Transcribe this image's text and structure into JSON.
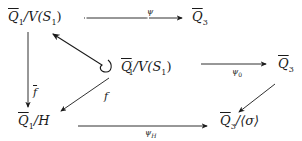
{
  "diagram": {
    "type": "commutative-diagram",
    "nodes": {
      "q1_vs1": {
        "base": "Q",
        "sub": "1",
        "rest": "/V(S",
        "rest_sub": "1",
        "close": ")"
      },
      "q3_top": {
        "base": "Q",
        "sub": "3"
      },
      "q1p_vs1": {
        "base": "Q",
        "prime": "′",
        "sub": "1",
        "rest": "/V(S",
        "rest_sub": "1",
        "close": ")"
      },
      "q3_right": {
        "base": "Q",
        "sub": "3"
      },
      "q1_h": {
        "base": "Q",
        "sub": "1",
        "rest": "/H"
      },
      "q3_sigma": {
        "base": "Q",
        "sub": "3",
        "rest": "/⟨σ⟩"
      }
    },
    "arrows": {
      "psi": {
        "label": "ψ",
        "from": "Q̄1/V(S1)",
        "to": "Q̄3"
      },
      "psi0": {
        "label": "ψ",
        "label_sub": "0",
        "from": "Q̄'1/V(S1)",
        "to": "Q̄3"
      },
      "psiH": {
        "label": "ψ",
        "label_sub": "H",
        "from": "Q̄1/H",
        "to": "Q̄3/⟨σ⟩"
      },
      "fbar": {
        "label": "f",
        "overline": true,
        "from": "Q̄1/V(S1)",
        "to": "Q̄1/H"
      },
      "f": {
        "label": "f",
        "from": "Q̄'1/V(S1)",
        "to": "Q̄1/H"
      },
      "hook": {
        "label": "",
        "from": "Q̄'1/V(S1)",
        "to": "Q̄1/V(S1)"
      },
      "q3_to_q3sigma": {
        "label": "",
        "from": "Q̄3",
        "to": "Q̄3/⟨σ⟩"
      }
    }
  }
}
